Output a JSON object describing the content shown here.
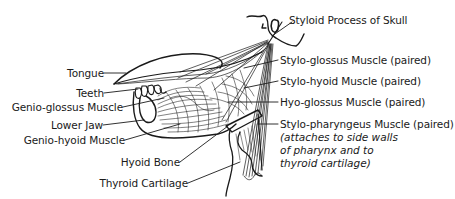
{
  "diagram": {
    "colors": {
      "ink": "#1a1a1a",
      "background": "#ffffff"
    },
    "labels_left": [
      {
        "id": "tongue",
        "text": "Tongue"
      },
      {
        "id": "teeth",
        "text": "Teeth"
      },
      {
        "id": "genio-glossus",
        "text": "Genio-glossus Muscle"
      },
      {
        "id": "lower-jaw",
        "text": "Lower Jaw"
      },
      {
        "id": "genio-hyoid",
        "text": "Genio-hyoid Muscle"
      },
      {
        "id": "hyoid-bone",
        "text": "Hyoid Bone"
      },
      {
        "id": "thyroid-cartilage",
        "text": "Thyroid Cartilage"
      }
    ],
    "labels_right": [
      {
        "id": "styloid-process",
        "text": "Styloid Process of Skull"
      },
      {
        "id": "stylo-glossus",
        "text": "Stylo-glossus Muscle (paired)"
      },
      {
        "id": "stylo-hyoid",
        "text": "Stylo-hyoid Muscle (paired)"
      },
      {
        "id": "hyo-glossus",
        "text": "Hyo-glossus Muscle (paired)"
      },
      {
        "id": "stylo-pharyngeus",
        "text": "Stylo-pharyngeus Muscle (paired)"
      }
    ],
    "note_lines": [
      "(attaches to side walls",
      "of pharynx and to",
      "thyroid cartilage)"
    ]
  }
}
